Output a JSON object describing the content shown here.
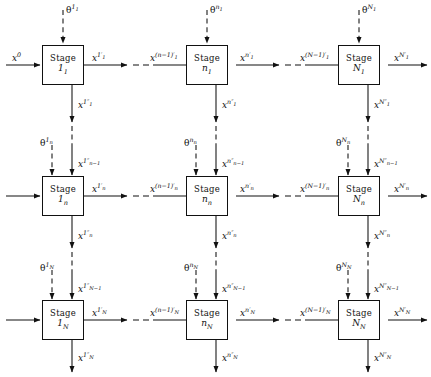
{
  "diagram": {
    "type": "multistage-network-grid",
    "title": "",
    "rows": 3,
    "cols": 3,
    "colors": {
      "stroke": "#111111",
      "background": "#ffffff",
      "text": "#111111"
    },
    "legend": {
      "solid_arrow": "signal flow",
      "dashed_arrow": "parameter input / continuation ellipsis"
    },
    "global_input": {
      "label_base": "x",
      "sup": "0",
      "sub": ""
    },
    "stage_word": "Stage",
    "nodes": [
      {
        "id": "stage-1-1",
        "row": 0,
        "col": 0,
        "word": "Stage",
        "index_base": "1",
        "index_sub": "1"
      },
      {
        "id": "stage-n-1",
        "row": 0,
        "col": 1,
        "word": "Stage",
        "index_base": "n",
        "index_sub": "1"
      },
      {
        "id": "stage-N-1",
        "row": 0,
        "col": 2,
        "word": "Stage",
        "index_base": "N",
        "index_sub": "1"
      },
      {
        "id": "stage-1-n",
        "row": 1,
        "col": 0,
        "word": "Stage",
        "index_base": "1",
        "index_sub": "n"
      },
      {
        "id": "stage-n-n",
        "row": 1,
        "col": 1,
        "word": "Stage",
        "index_base": "n",
        "index_sub": "n"
      },
      {
        "id": "stage-N-n",
        "row": 1,
        "col": 2,
        "word": "Stage",
        "index_base": "N",
        "index_sub": "n"
      },
      {
        "id": "stage-1-N",
        "row": 2,
        "col": 0,
        "word": "Stage",
        "index_base": "1",
        "index_sub": "N"
      },
      {
        "id": "stage-n-N",
        "row": 2,
        "col": 1,
        "word": "Stage",
        "index_base": "n",
        "index_sub": "N"
      },
      {
        "id": "stage-N-N",
        "row": 2,
        "col": 2,
        "word": "Stage",
        "index_base": "N",
        "index_sub": "N"
      }
    ],
    "theta_inputs": [
      {
        "id": "theta-1-1",
        "base": "θ",
        "sup": "1",
        "sup_sub": "1"
      },
      {
        "id": "theta-n-1",
        "base": "θ",
        "sup": "n",
        "sup_sub": "1"
      },
      {
        "id": "theta-N-1",
        "base": "θ",
        "sup": "N",
        "sup_sub": "1"
      },
      {
        "id": "theta-1-n",
        "base": "θ",
        "sup": "1",
        "sup_sub": "n"
      },
      {
        "id": "theta-n-n",
        "base": "θ",
        "sup": "n",
        "sup_sub": "n"
      },
      {
        "id": "theta-N-n",
        "base": "θ",
        "sup": "N",
        "sup_sub": "n"
      },
      {
        "id": "theta-1-N",
        "base": "θ",
        "sup": "1",
        "sup_sub": "N"
      },
      {
        "id": "theta-n-N",
        "base": "θ",
        "sup": "n",
        "sup_sub": "N"
      },
      {
        "id": "theta-N-N",
        "base": "θ",
        "sup": "N",
        "sup_sub": "N"
      }
    ],
    "horizontal_labels": [
      {
        "id": "x0",
        "base": "x",
        "sup": "0",
        "prime": "",
        "sub": ""
      },
      {
        "id": "x-1p-1",
        "base": "x",
        "sup": "1",
        "prime": "′",
        "sub": "1"
      },
      {
        "id": "x-nm1p-1",
        "base": "x",
        "sup": "(n−1)",
        "prime": "′",
        "sub": "1"
      },
      {
        "id": "x-np-1",
        "base": "x",
        "sup": "n",
        "prime": "′",
        "sub": "1"
      },
      {
        "id": "x-Nm1p-1",
        "base": "x",
        "sup": "(N−1)",
        "prime": "′",
        "sub": "1"
      },
      {
        "id": "x-Np-1",
        "base": "x",
        "sup": "N",
        "prime": "′",
        "sub": "1"
      },
      {
        "id": "x-1p-n",
        "base": "x",
        "sup": "1",
        "prime": "′",
        "sub": "n"
      },
      {
        "id": "x-nm1p-n",
        "base": "x",
        "sup": "(n−1)",
        "prime": "′",
        "sub": "n"
      },
      {
        "id": "x-np-n",
        "base": "x",
        "sup": "n",
        "prime": "′",
        "sub": "n"
      },
      {
        "id": "x-Nm1p-n",
        "base": "x",
        "sup": "(N−1)",
        "prime": "′",
        "sub": "n"
      },
      {
        "id": "x-Np-n",
        "base": "x",
        "sup": "N",
        "prime": "′",
        "sub": "n"
      },
      {
        "id": "x-1p-N",
        "base": "x",
        "sup": "1",
        "prime": "′",
        "sub": "N"
      },
      {
        "id": "x-nm1p-N",
        "base": "x",
        "sup": "(n−1)",
        "prime": "′",
        "sub": "N"
      },
      {
        "id": "x-np-N",
        "base": "x",
        "sup": "n",
        "prime": "′",
        "sub": "N"
      },
      {
        "id": "x-Nm1p-N",
        "base": "x",
        "sup": "(N−1)",
        "prime": "′",
        "sub": "N"
      },
      {
        "id": "x-Np-N",
        "base": "x",
        "sup": "N",
        "prime": "′",
        "sub": "N"
      }
    ],
    "vertical_labels": [
      {
        "id": "x-1pp-1",
        "base": "x",
        "sup": "1",
        "prime": "″",
        "sub": "1"
      },
      {
        "id": "x-npp-1",
        "base": "x",
        "sup": "n",
        "prime": "″",
        "sub": "1"
      },
      {
        "id": "x-Npp-1",
        "base": "x",
        "sup": "N",
        "prime": "″",
        "sub": "1"
      },
      {
        "id": "x-1pp-nm1",
        "base": "x",
        "sup": "1",
        "prime": "″",
        "sub": "n−1"
      },
      {
        "id": "x-npp-nm1",
        "base": "x",
        "sup": "n",
        "prime": "″",
        "sub": "n−1"
      },
      {
        "id": "x-Npp-nm1",
        "base": "x",
        "sup": "N",
        "prime": "″",
        "sub": "n−1"
      },
      {
        "id": "x-1pp-n",
        "base": "x",
        "sup": "1",
        "prime": "″",
        "sub": "n"
      },
      {
        "id": "x-npp-n",
        "base": "x",
        "sup": "n",
        "prime": "″",
        "sub": "n"
      },
      {
        "id": "x-Npp-n",
        "base": "x",
        "sup": "N",
        "prime": "″",
        "sub": "n"
      },
      {
        "id": "x-1pp-Nm1",
        "base": "x",
        "sup": "1",
        "prime": "″",
        "sub": "N−1"
      },
      {
        "id": "x-npp-Nm1",
        "base": "x",
        "sup": "n",
        "prime": "″",
        "sub": "N−1"
      },
      {
        "id": "x-Npp-Nm1",
        "base": "x",
        "sup": "N",
        "prime": "″",
        "sub": "N−1"
      },
      {
        "id": "x-1pp-N",
        "base": "x",
        "sup": "1",
        "prime": "″",
        "sub": "N"
      },
      {
        "id": "x-npp-N",
        "base": "x",
        "sup": "n",
        "prime": "″",
        "sub": "N"
      },
      {
        "id": "x-Npp-N",
        "base": "x",
        "sup": "N",
        "prime": "″",
        "sub": "N"
      }
    ]
  }
}
